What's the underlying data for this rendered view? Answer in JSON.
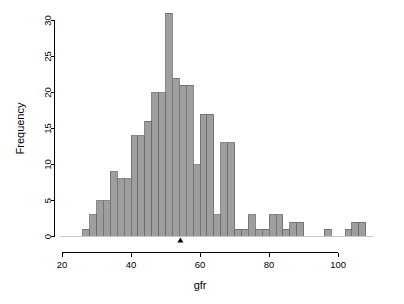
{
  "chart_data": {
    "type": "bar",
    "subtype": "histogram",
    "title": "",
    "xlabel": "gfr",
    "ylabel": "Frequency",
    "xlim": [
      20,
      110
    ],
    "ylim": [
      0,
      31
    ],
    "grid": false,
    "legend": "none",
    "bin_width": 2,
    "bar_fill_color": "#9e9e9e",
    "bar_border_color": "#6b6b6b",
    "axis_color": "#000000",
    "background_color": "#ffffff",
    "xticks": [
      20,
      40,
      60,
      80,
      100
    ],
    "xtick_labels": [
      "20",
      "40",
      "60",
      "80",
      "100"
    ],
    "yticks": [
      0,
      5,
      10,
      15,
      20,
      25,
      30
    ],
    "ytick_labels": [
      "0",
      "5",
      "10",
      "15",
      "20",
      "25",
      "30"
    ],
    "bins": [
      {
        "left": 26,
        "right": 28,
        "value": 1
      },
      {
        "left": 28,
        "right": 30,
        "value": 3
      },
      {
        "left": 30,
        "right": 32,
        "value": 5
      },
      {
        "left": 32,
        "right": 34,
        "value": 5
      },
      {
        "left": 34,
        "right": 36,
        "value": 9
      },
      {
        "left": 36,
        "right": 38,
        "value": 8
      },
      {
        "left": 38,
        "right": 40,
        "value": 8
      },
      {
        "left": 40,
        "right": 42,
        "value": 14
      },
      {
        "left": 42,
        "right": 44,
        "value": 14
      },
      {
        "left": 44,
        "right": 46,
        "value": 16
      },
      {
        "left": 46,
        "right": 48,
        "value": 20
      },
      {
        "left": 48,
        "right": 50,
        "value": 20
      },
      {
        "left": 50,
        "right": 52,
        "value": 31
      },
      {
        "left": 52,
        "right": 54,
        "value": 22
      },
      {
        "left": 54,
        "right": 56,
        "value": 21
      },
      {
        "left": 56,
        "right": 58,
        "value": 21
      },
      {
        "left": 58,
        "right": 60,
        "value": 10
      },
      {
        "left": 60,
        "right": 62,
        "value": 17
      },
      {
        "left": 62,
        "right": 64,
        "value": 17
      },
      {
        "left": 64,
        "right": 66,
        "value": 3
      },
      {
        "left": 66,
        "right": 68,
        "value": 13
      },
      {
        "left": 68,
        "right": 70,
        "value": 13
      },
      {
        "left": 70,
        "right": 72,
        "value": 1
      },
      {
        "left": 72,
        "right": 74,
        "value": 1
      },
      {
        "left": 74,
        "right": 76,
        "value": 3
      },
      {
        "left": 76,
        "right": 78,
        "value": 1
      },
      {
        "left": 78,
        "right": 80,
        "value": 1
      },
      {
        "left": 80,
        "right": 82,
        "value": 3
      },
      {
        "left": 82,
        "right": 84,
        "value": 3
      },
      {
        "left": 84,
        "right": 86,
        "value": 1
      },
      {
        "left": 86,
        "right": 88,
        "value": 2
      },
      {
        "left": 88,
        "right": 90,
        "value": 2
      },
      {
        "left": 96,
        "right": 98,
        "value": 1
      },
      {
        "left": 102,
        "right": 104,
        "value": 1
      },
      {
        "left": 104,
        "right": 106,
        "value": 2
      },
      {
        "left": 106,
        "right": 108,
        "value": 2
      }
    ],
    "annotations": [
      {
        "name": "mean-marker",
        "shape": "triangle",
        "x": 54.3,
        "y": 0
      }
    ]
  }
}
